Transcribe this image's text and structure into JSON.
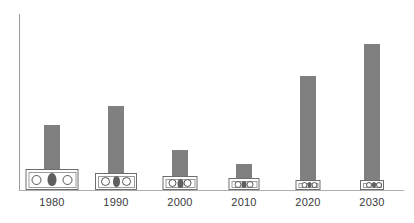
{
  "chart_data": {
    "type": "bar",
    "title": "",
    "subtitle": "",
    "xlabel": "",
    "ylabel": "",
    "categories": [
      "1980",
      "1990",
      "2000",
      "2010",
      "2020",
      "2030"
    ],
    "values": [
      37,
      48,
      23,
      15,
      65,
      83
    ],
    "ylim": [
      0,
      100
    ],
    "grid": false,
    "legend": null,
    "series": [
      {
        "name": "value",
        "values": [
          37,
          48,
          23,
          15,
          65,
          83
        ]
      }
    ],
    "annotations": [
      {
        "name": "money-icon",
        "category": "1980",
        "relative_size": 100
      },
      {
        "name": "money-icon",
        "category": "1990",
        "relative_size": 80
      },
      {
        "name": "money-icon",
        "category": "2000",
        "relative_size": 66
      },
      {
        "name": "money-icon",
        "category": "2010",
        "relative_size": 58
      },
      {
        "name": "money-icon",
        "category": "2020",
        "relative_size": 48
      },
      {
        "name": "money-icon",
        "category": "2030",
        "relative_size": 46
      }
    ],
    "colors": {
      "bar": "#808080",
      "axis": "#9a9a9a",
      "baseline": "#aeaeae",
      "label": "#3b3b3b",
      "icon_border": "#6e6e6e",
      "icon_fill": "#ffffff",
      "icon_portrait": "#5f5f5f",
      "background": "#ffffff"
    }
  },
  "axis": {
    "y_axis_name": "y-axis-line",
    "x_axis_name": "x-axis-line"
  }
}
